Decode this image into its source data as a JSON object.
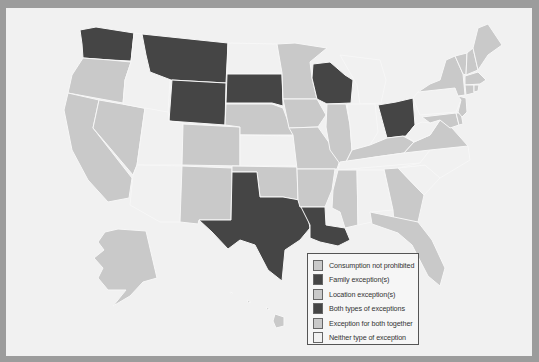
{
  "legend": {
    "items": [
      {
        "label": "Consumption not prohibited",
        "color": "#c9c9c9"
      },
      {
        "label": "Family exception(s)",
        "color": "#454545"
      },
      {
        "label": "Location exception(s)",
        "color": "#c9c9c9"
      },
      {
        "label": "Both types of exceptions",
        "color": "#454545"
      },
      {
        "label": "Exception for both together",
        "color": "#c9c9c9"
      },
      {
        "label": "Neither type of exception",
        "color": "#f1f1f1"
      }
    ]
  },
  "colors": {
    "frame": "#9c9c9c",
    "background": "#f1f1f1",
    "dark": "#454545",
    "light": "#c9c9c9",
    "none": "#f1f1f1"
  },
  "states": {
    "dark": [
      "WA",
      "MT",
      "WY",
      "SD",
      "WI",
      "OH",
      "TX",
      "LA"
    ],
    "light": [
      "OR",
      "CA",
      "NV",
      "CO",
      "NM",
      "NE",
      "OK",
      "MN",
      "IA",
      "MO",
      "AR",
      "IL",
      "KY",
      "VA",
      "MS",
      "GA",
      "FL",
      "NY",
      "VT",
      "NH",
      "ME",
      "MA",
      "CT",
      "RI",
      "NJ",
      "DE",
      "MD",
      "AK",
      "HI"
    ],
    "none": [
      "ID",
      "UT",
      "AZ",
      "ND",
      "KS",
      "MI",
      "IN",
      "TN",
      "AL",
      "SC",
      "NC",
      "WV",
      "PA"
    ]
  }
}
